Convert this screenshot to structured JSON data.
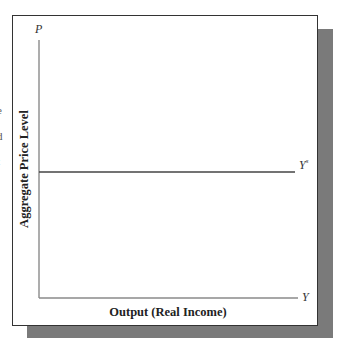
{
  "edge_fragments": [
    "e",
    "d",
    "t"
  ],
  "chart_data": {
    "type": "line",
    "title": "",
    "xlabel": "Output (Real Income)",
    "ylabel": "Aggregate Price Level",
    "x_axis_symbol": "Y",
    "y_axis_symbol": "P",
    "grid": false,
    "legend": null,
    "series": [
      {
        "name": "Y^s",
        "label": "Y",
        "label_superscript": "s",
        "description": "Horizontal short-run aggregate supply curve at a fixed price level",
        "x": [
          0,
          1
        ],
        "y": [
          0.5,
          0.5
        ]
      }
    ],
    "xlim": [
      0,
      1
    ],
    "ylim": [
      0,
      1
    ],
    "ticks": "none"
  },
  "colors": {
    "axis": "#8a8a8a",
    "curve": "#444444",
    "panel_border": "#333333",
    "shadow": "#7a7a7a"
  }
}
